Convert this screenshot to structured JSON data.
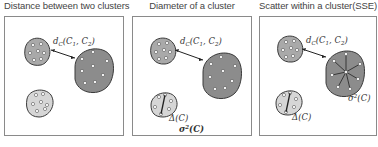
{
  "panels": [
    {
      "title": "Distance between two clusters",
      "labels": {
        "distance": "dC(C1,C2)"
      }
    },
    {
      "title": "Diameter of a cluster",
      "labels": {
        "distance": "dC(C1,C2)",
        "diameter": "Δ(C)",
        "variance": "σ²(C)"
      }
    },
    {
      "title": "Scatter within a cluster(SSE)",
      "labels": {
        "distance": "dC(C1,C2)",
        "diameter": "Δ(C)",
        "variance": "σ²(C)"
      }
    }
  ],
  "colors": {
    "cluster_dark": "#8c8c8c",
    "cluster_mid": "#a9a9a9",
    "cluster_light": "#d6d6d6",
    "outline": "#3a3a3a",
    "point": "#ffffff",
    "panel_border": "#8a8a8a"
  }
}
